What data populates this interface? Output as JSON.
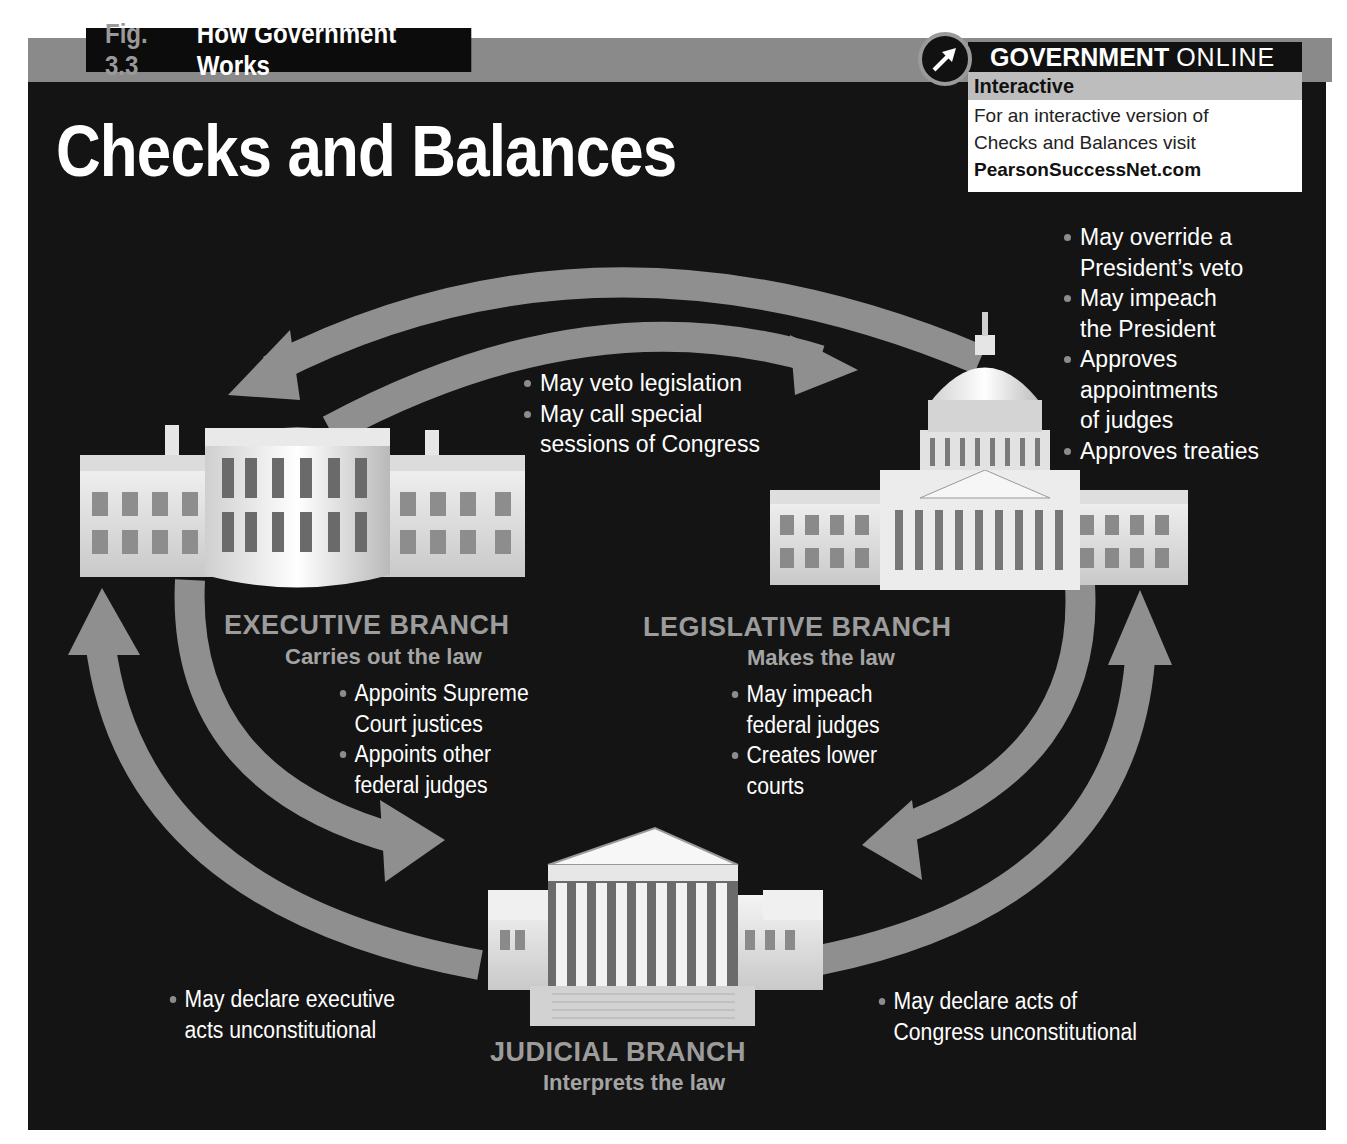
{
  "header": {
    "fig_number": "Fig. 3.3",
    "fig_title": "How Government Works",
    "title": "Checks and Balances"
  },
  "online_box": {
    "icon": "arrow-cursor-icon",
    "brand_bold": "GOVERNMENT",
    "brand_light": "ONLINE",
    "label": "Interactive",
    "line1": "For an interactive version of",
    "line2": "Checks and Balances visit",
    "link": "PearsonSuccessNet.com"
  },
  "branches": {
    "executive": {
      "name": "EXECUTIVE BRANCH",
      "role": "Carries out the law",
      "building": "white-house-icon",
      "checks_on_legislative": [
        "May veto legislation",
        "May call special sessions of Congress"
      ],
      "checks_on_judicial": [
        "Appoints Supreme Court justices",
        "Appoints other federal judges"
      ]
    },
    "legislative": {
      "name": "LEGISLATIVE BRANCH",
      "role": "Makes the law",
      "building": "capitol-icon",
      "checks_on_executive": [
        "May override a President’s veto",
        "May impeach the President",
        "Approves appointments of judges",
        "Approves treaties"
      ],
      "checks_on_judicial": [
        "May impeach federal judges",
        "Creates lower courts"
      ]
    },
    "judicial": {
      "name": "JUDICIAL BRANCH",
      "role": "Interprets the law",
      "building": "supreme-court-icon",
      "checks_on_executive": [
        "May declare executive acts unconstitutional"
      ],
      "checks_on_legislative": [
        "May declare acts of Congress unconstitutional"
      ]
    }
  },
  "lines": {
    "veto_1": "May veto legislation",
    "veto_2a": "May call special",
    "veto_2b": "sessions of Congress",
    "leg_1a": "May override a",
    "leg_1b": "President’s veto",
    "leg_2a": "May impeach",
    "leg_2b": "the President",
    "leg_3a": "Approves",
    "leg_3b": "appointments",
    "leg_3c": "of judges",
    "leg_4": "Approves treaties",
    "exec_1a": "Appoints Supreme",
    "exec_1b": "Court justices",
    "exec_2a": "Appoints other",
    "exec_2b": "federal judges",
    "legj_1a": "May impeach",
    "legj_1b": "federal judges",
    "legj_2a": "Creates lower",
    "legj_2b": "courts",
    "jud_e_a": "May declare executive",
    "jud_e_b": "acts unconstitutional",
    "jud_l_a": "May declare acts of",
    "jud_l_b": "Congress unconstitutional"
  },
  "colors": {
    "background": "#141414",
    "arrow": "#8f8f8f",
    "band": "#8a8a8a",
    "text": "#ffffff",
    "branch_label": "#9c9c9c"
  }
}
